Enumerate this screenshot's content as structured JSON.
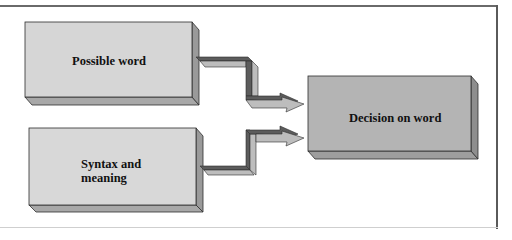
{
  "diagram": {
    "boxes": [
      {
        "id": "possible-word",
        "label": "Possible word",
        "face_color": "#d6d6d6"
      },
      {
        "id": "syntax-and-meaning",
        "label_line1": "Syntax and",
        "label_line2": "meaning",
        "face_color": "#d8d8d8"
      },
      {
        "id": "decision-on-word",
        "label": "Decision on word",
        "face_color": "#b4b4b4"
      }
    ],
    "arrows": [
      {
        "from": "possible-word",
        "to": "decision-on-word"
      },
      {
        "from": "syntax-and-meaning",
        "to": "decision-on-word"
      }
    ],
    "colors": {
      "side": "#9a9a9a",
      "bottom": "#a8a8a8",
      "edge": "#2e2e2e",
      "arrow_top": "#5c5c5c",
      "arrow_face": "#bdbdbd"
    }
  }
}
